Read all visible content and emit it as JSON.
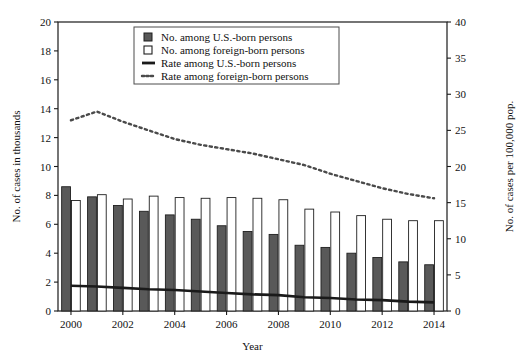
{
  "chart_data": {
    "type": "bar",
    "title": "",
    "subtitle": "",
    "xlabel": "Year",
    "ylabel": "No. of cases in thousands",
    "y2label": "No. of cases per 100,000 pop.",
    "categories": [
      2000,
      2001,
      2002,
      2003,
      2004,
      2005,
      2006,
      2007,
      2008,
      2009,
      2010,
      2011,
      2012,
      2013,
      2014
    ],
    "x": [
      2000,
      2001,
      2002,
      2003,
      2004,
      2005,
      2006,
      2007,
      2008,
      2009,
      2010,
      2011,
      2012,
      2013,
      2014
    ],
    "xlim": [
      1999.5,
      2014.5
    ],
    "ylim": [
      0,
      20
    ],
    "y2lim": [
      0,
      40
    ],
    "yticks": [
      0,
      2,
      4,
      6,
      8,
      10,
      12,
      14,
      16,
      18,
      20
    ],
    "y2ticks": [
      0,
      5,
      10,
      15,
      20,
      25,
      30,
      35,
      40
    ],
    "xticks": [
      2000,
      2002,
      2004,
      2006,
      2008,
      2010,
      2012,
      2014
    ],
    "xticklabels": [
      "2000",
      "2002",
      "2004",
      "2006",
      "2008",
      "2010",
      "2012",
      "2014"
    ],
    "grid": false,
    "legend_position": "upper center",
    "series": [
      {
        "name": "No. among U.S.-born persons",
        "kind": "bar",
        "axis": "left",
        "color": "#595959",
        "values": [
          8.6,
          7.9,
          7.3,
          6.9,
          6.65,
          6.35,
          5.9,
          5.5,
          5.3,
          4.55,
          4.4,
          4.0,
          3.7,
          3.4,
          3.2
        ]
      },
      {
        "name": "No. among foreign-born persons",
        "kind": "bar",
        "axis": "left",
        "color": "#ffffff",
        "values": [
          7.65,
          8.05,
          7.75,
          7.95,
          7.85,
          7.8,
          7.85,
          7.8,
          7.7,
          7.05,
          6.85,
          6.6,
          6.35,
          6.25,
          6.25
        ]
      },
      {
        "name": "Rate among U.S.-born persons",
        "kind": "line",
        "style": "solid",
        "axis": "right",
        "color": "#1a1a1a",
        "values": [
          3.5,
          3.4,
          3.2,
          3.0,
          2.9,
          2.7,
          2.5,
          2.3,
          2.2,
          1.9,
          1.8,
          1.6,
          1.5,
          1.3,
          1.2
        ]
      },
      {
        "name": "Rate among foreign-born persons",
        "kind": "line",
        "style": "dotted",
        "axis": "right",
        "color": "#4a4a4a",
        "values": [
          26.4,
          27.6,
          26.2,
          25.0,
          23.8,
          23.0,
          22.4,
          21.8,
          21.0,
          20.2,
          19.0,
          18.0,
          17.0,
          16.2,
          15.6
        ]
      }
    ]
  },
  "legend": {
    "items": [
      {
        "label": "No. among U.S.-born persons",
        "marker": "filled-square-swatch"
      },
      {
        "label": "No. among foreign-born persons",
        "marker": "hollow-square-swatch"
      },
      {
        "label": "Rate among U.S.-born persons",
        "marker": "solid-line-swatch"
      },
      {
        "label": "Rate among foreign-born persons",
        "marker": "dotted-line-swatch"
      }
    ]
  },
  "axes": {
    "left_title": "No. of cases in thousands",
    "right_title": "No. of cases per 100,000 pop.",
    "bottom_title": "Year"
  }
}
